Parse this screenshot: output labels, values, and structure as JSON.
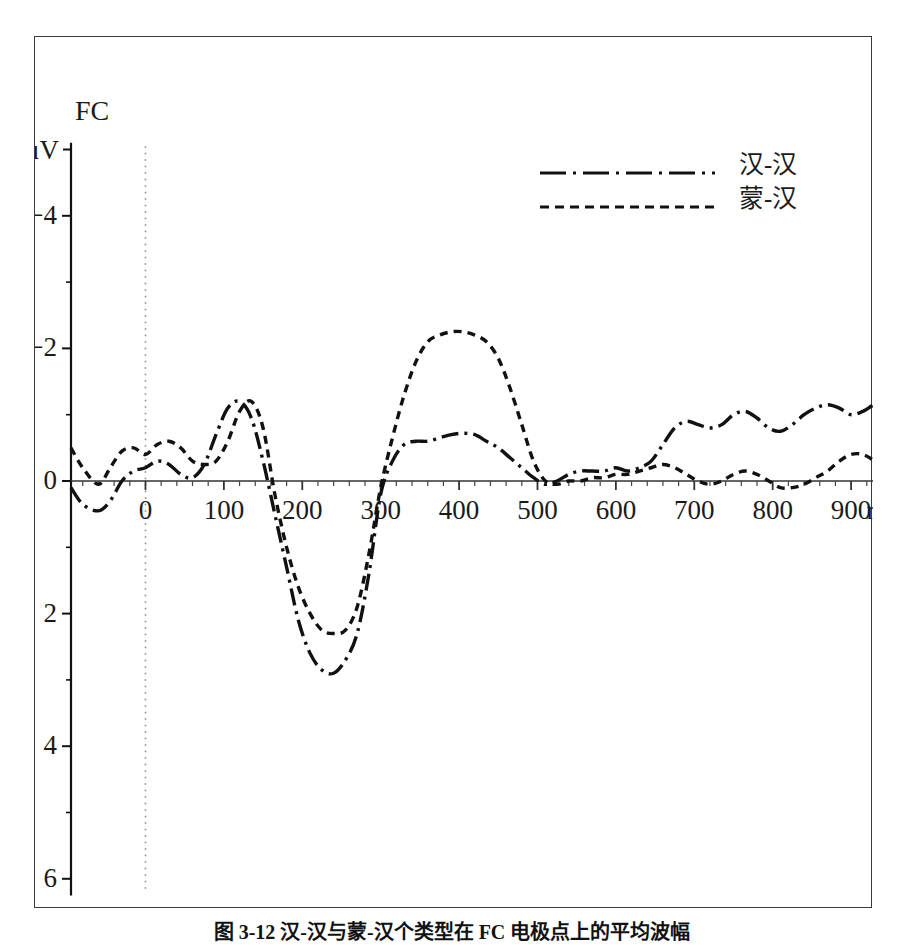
{
  "figure": {
    "electrode_label": "FC",
    "caption": "图 3-12  汉-汉与蒙-汉个类型在 FC 电极点上的平均波幅"
  },
  "legend": {
    "position": "top-right",
    "entries": [
      {
        "label": "汉-汉",
        "style": "dash-dot"
      },
      {
        "label": "蒙-汉",
        "style": "dashed"
      }
    ]
  },
  "axes": {
    "y_unit": "μV",
    "x_unit": "ms",
    "y_ticks": [
      "-4",
      "-2",
      "0",
      "2",
      "4",
      "6"
    ],
    "x_ticks": [
      "0",
      "100",
      "200",
      "300",
      "400",
      "500",
      "600",
      "700",
      "800",
      "900"
    ]
  },
  "chart_data": {
    "type": "line",
    "title": "图 3-12  汉-汉与蒙-汉个类型在 FC 电极点上的平均波幅",
    "subtitle": "FC",
    "xlabel": "ms",
    "ylabel": "μV",
    "xlim": [
      -95,
      965
    ],
    "ylim": [
      6,
      -5
    ],
    "y_inverted": true,
    "grid": false,
    "legend_position": "top-right",
    "annotations": [
      {
        "type": "vline",
        "x": 0,
        "style": "dotted",
        "note": "stimulus onset"
      },
      {
        "type": "hline",
        "y": 0,
        "style": "solid",
        "note": "baseline / x-axis"
      }
    ],
    "x": [
      -95,
      -80,
      -60,
      -45,
      -30,
      -15,
      0,
      15,
      30,
      45,
      60,
      75,
      90,
      105,
      120,
      135,
      150,
      165,
      180,
      195,
      210,
      225,
      240,
      255,
      270,
      285,
      300,
      315,
      330,
      345,
      360,
      375,
      390,
      405,
      420,
      435,
      450,
      465,
      480,
      495,
      510,
      525,
      540,
      555,
      570,
      585,
      600,
      615,
      630,
      645,
      660,
      675,
      690,
      705,
      720,
      735,
      750,
      765,
      780,
      795,
      810,
      825,
      840,
      855,
      870,
      885,
      900,
      915,
      930,
      945,
      960
    ],
    "series": [
      {
        "name": "汉-汉",
        "style": "dash-dot",
        "values": [
          0.1,
          0.35,
          0.45,
          0.3,
          0.0,
          -0.15,
          -0.2,
          -0.3,
          -0.25,
          -0.1,
          -0.05,
          -0.25,
          -0.7,
          -1.1,
          -1.2,
          -0.95,
          -0.3,
          0.5,
          1.3,
          2.1,
          2.6,
          2.85,
          2.9,
          2.7,
          2.3,
          1.4,
          0.2,
          -0.3,
          -0.55,
          -0.6,
          -0.6,
          -0.65,
          -0.7,
          -0.72,
          -0.7,
          -0.6,
          -0.5,
          -0.35,
          -0.2,
          -0.05,
          0.05,
          0.0,
          -0.1,
          -0.15,
          -0.15,
          -0.15,
          -0.2,
          -0.15,
          -0.2,
          -0.3,
          -0.55,
          -0.8,
          -0.9,
          -0.85,
          -0.8,
          -0.85,
          -1.0,
          -1.05,
          -0.95,
          -0.8,
          -0.75,
          -0.85,
          -1.0,
          -1.1,
          -1.15,
          -1.1,
          -1.0,
          -1.05,
          -1.15,
          -1.15,
          -1.1
        ]
      },
      {
        "name": "蒙-汉",
        "style": "dashed",
        "values": [
          -0.5,
          -0.2,
          0.05,
          -0.2,
          -0.45,
          -0.5,
          -0.4,
          -0.55,
          -0.6,
          -0.5,
          -0.3,
          -0.25,
          -0.3,
          -0.6,
          -1.05,
          -1.2,
          -0.8,
          0.2,
          1.0,
          1.6,
          2.0,
          2.25,
          2.3,
          2.25,
          1.9,
          1.1,
          0.1,
          -0.65,
          -1.3,
          -1.8,
          -2.1,
          -2.2,
          -2.25,
          -2.25,
          -2.2,
          -2.1,
          -1.85,
          -1.4,
          -0.85,
          -0.3,
          0.0,
          0.05,
          0.0,
          0.0,
          -0.05,
          -0.05,
          -0.1,
          -0.1,
          -0.15,
          -0.2,
          -0.25,
          -0.2,
          -0.1,
          0.0,
          0.05,
          0.0,
          -0.1,
          -0.15,
          -0.1,
          0.0,
          0.1,
          0.1,
          0.05,
          -0.05,
          -0.15,
          -0.3,
          -0.4,
          -0.4,
          -0.3,
          -0.15,
          -0.05
        ]
      }
    ]
  }
}
